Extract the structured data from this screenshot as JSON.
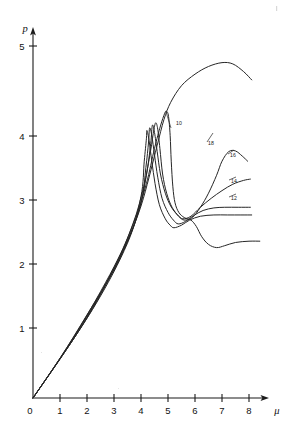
{
  "figure": {
    "background_color": "#ffffff",
    "ink_color": "#262626"
  },
  "axes": {
    "y_axis_label": "p",
    "x_axis_label": "μ",
    "y_ticks": [
      "1",
      "2",
      "3",
      "4",
      "5"
    ],
    "x_ticks": [
      "0",
      "1",
      "2",
      "3",
      "4",
      "5",
      "6",
      "7",
      "8"
    ],
    "origin_label": "0"
  },
  "curve_labels": {
    "l10": "10",
    "l18": "18",
    "l16": "16",
    "l14": "14",
    "l12": "12"
  },
  "chart_data": {
    "type": "line",
    "title": "",
    "xlabel": "μ",
    "ylabel": "p",
    "xlim": [
      0,
      8.6
    ],
    "ylim": [
      0,
      5.5
    ],
    "grid": false,
    "legend": "inline-curve-labels",
    "xticks": [
      0,
      1,
      2,
      3,
      4,
      5,
      6,
      7,
      8
    ],
    "yticks": [
      1,
      2,
      3,
      4,
      5
    ],
    "series": [
      {
        "name": "top",
        "label": "",
        "comment": "rises on common ramp, continues past bundle to a broad maximum near mu=7.2, p=5.2, then falls",
        "points": [
          [
            0.0,
            0.0
          ],
          [
            1.0,
            0.62
          ],
          [
            2.0,
            1.3
          ],
          [
            3.0,
            2.0
          ],
          [
            3.6,
            2.55
          ],
          [
            4.0,
            3.0
          ],
          [
            4.3,
            3.45
          ],
          [
            4.6,
            3.95
          ],
          [
            4.85,
            4.35
          ],
          [
            5.1,
            4.62
          ],
          [
            5.5,
            4.88
          ],
          [
            6.0,
            5.06
          ],
          [
            6.5,
            5.18
          ],
          [
            7.0,
            5.24
          ],
          [
            7.4,
            5.22
          ],
          [
            7.8,
            5.1
          ],
          [
            8.1,
            4.97
          ]
        ]
      },
      {
        "name": "curve-10",
        "label": "10",
        "comment": "outermost of bundle; peak ~4.48 at mu~4.9, near-vertical drop to minimum 2.82 at mu~5.6, then descends to lower branch ~2.35 and plateaus at 2.45",
        "points": [
          [
            0.0,
            0.0
          ],
          [
            1.2,
            0.75
          ],
          [
            2.4,
            1.56
          ],
          [
            3.2,
            2.2
          ],
          [
            3.8,
            2.82
          ],
          [
            4.2,
            3.35
          ],
          [
            4.5,
            3.9
          ],
          [
            4.72,
            4.25
          ],
          [
            4.88,
            4.45
          ],
          [
            4.95,
            4.48
          ],
          [
            5.02,
            4.4
          ],
          [
            5.08,
            4.1
          ],
          [
            5.12,
            3.7
          ],
          [
            5.18,
            3.3
          ],
          [
            5.26,
            3.05
          ],
          [
            5.4,
            2.9
          ],
          [
            5.6,
            2.82
          ],
          [
            5.85,
            2.78
          ],
          [
            6.05,
            2.68
          ],
          [
            6.25,
            2.52
          ],
          [
            6.5,
            2.4
          ],
          [
            6.8,
            2.35
          ],
          [
            7.1,
            2.38
          ],
          [
            7.5,
            2.43
          ],
          [
            8.0,
            2.45
          ],
          [
            8.4,
            2.45
          ]
        ]
      },
      {
        "name": "curve-18",
        "label": "18",
        "comment": "bundle member; peak ~4.3 at mu~4.5, drops to minimum 2.78 near mu~5.5, then rises strongly to a maximum ~3.85 at mu~7.3",
        "points": [
          [
            0.0,
            0.0
          ],
          [
            1.5,
            0.94
          ],
          [
            3.0,
            2.05
          ],
          [
            3.7,
            2.72
          ],
          [
            4.1,
            3.3
          ],
          [
            4.35,
            3.85
          ],
          [
            4.48,
            4.2
          ],
          [
            4.55,
            4.3
          ],
          [
            4.62,
            4.2
          ],
          [
            4.7,
            3.9
          ],
          [
            4.8,
            3.5
          ],
          [
            4.95,
            3.2
          ],
          [
            5.15,
            2.98
          ],
          [
            5.4,
            2.84
          ],
          [
            5.6,
            2.78
          ],
          [
            5.9,
            2.82
          ],
          [
            6.2,
            2.98
          ],
          [
            6.5,
            3.2
          ],
          [
            6.8,
            3.48
          ],
          [
            7.0,
            3.7
          ],
          [
            7.25,
            3.85
          ],
          [
            7.5,
            3.86
          ],
          [
            7.75,
            3.78
          ],
          [
            7.95,
            3.7
          ]
        ]
      },
      {
        "name": "curve-16",
        "label": "16",
        "comment": "bundle member; peak ~4.28 at mu~4.42, minimum 2.8 near mu~5.5, then rises steadily to ~3.42 at mu~8",
        "points": [
          [
            0.0,
            0.0
          ],
          [
            1.8,
            1.12
          ],
          [
            3.2,
            2.2
          ],
          [
            3.9,
            2.9
          ],
          [
            4.2,
            3.48
          ],
          [
            4.36,
            3.98
          ],
          [
            4.42,
            4.26
          ],
          [
            4.5,
            4.15
          ],
          [
            4.6,
            3.85
          ],
          [
            4.72,
            3.5
          ],
          [
            4.9,
            3.2
          ],
          [
            5.1,
            3.0
          ],
          [
            5.35,
            2.86
          ],
          [
            5.55,
            2.8
          ],
          [
            5.85,
            2.84
          ],
          [
            6.2,
            2.98
          ],
          [
            6.6,
            3.12
          ],
          [
            7.0,
            3.24
          ],
          [
            7.4,
            3.34
          ],
          [
            7.8,
            3.4
          ],
          [
            8.05,
            3.42
          ]
        ]
      },
      {
        "name": "curve-14",
        "label": "14",
        "comment": "bundle member; peak ~4.22 at mu~4.32, minimum 2.72 near mu~5.35, then rises to a flat plateau at ~2.98",
        "points": [
          [
            0.0,
            0.0
          ],
          [
            2.0,
            1.25
          ],
          [
            3.4,
            2.35
          ],
          [
            4.0,
            3.05
          ],
          [
            4.18,
            3.6
          ],
          [
            4.28,
            4.0
          ],
          [
            4.32,
            4.22
          ],
          [
            4.4,
            4.1
          ],
          [
            4.5,
            3.8
          ],
          [
            4.62,
            3.45
          ],
          [
            4.78,
            3.12
          ],
          [
            5.0,
            2.9
          ],
          [
            5.2,
            2.78
          ],
          [
            5.38,
            2.72
          ],
          [
            5.65,
            2.76
          ],
          [
            5.95,
            2.85
          ],
          [
            6.3,
            2.93
          ],
          [
            6.7,
            2.97
          ],
          [
            7.1,
            2.98
          ],
          [
            7.6,
            2.98
          ],
          [
            8.05,
            2.98
          ]
        ]
      },
      {
        "name": "curve-12",
        "label": "12",
        "comment": "innermost bundle member; peak ~4.18 at mu~4.22, shallowest minimum 2.66 near mu~5.2, then flat plateau at ~2.86",
        "points": [
          [
            0.0,
            0.0
          ],
          [
            2.2,
            1.38
          ],
          [
            3.5,
            2.42
          ],
          [
            4.0,
            3.15
          ],
          [
            4.12,
            3.7
          ],
          [
            4.2,
            4.05
          ],
          [
            4.22,
            4.18
          ],
          [
            4.3,
            4.02
          ],
          [
            4.4,
            3.7
          ],
          [
            4.52,
            3.35
          ],
          [
            4.68,
            3.02
          ],
          [
            4.9,
            2.8
          ],
          [
            5.08,
            2.7
          ],
          [
            5.22,
            2.66
          ],
          [
            5.5,
            2.7
          ],
          [
            5.8,
            2.78
          ],
          [
            6.2,
            2.84
          ],
          [
            6.7,
            2.86
          ],
          [
            7.2,
            2.86
          ],
          [
            7.7,
            2.86
          ],
          [
            8.1,
            2.86
          ]
        ]
      }
    ]
  }
}
